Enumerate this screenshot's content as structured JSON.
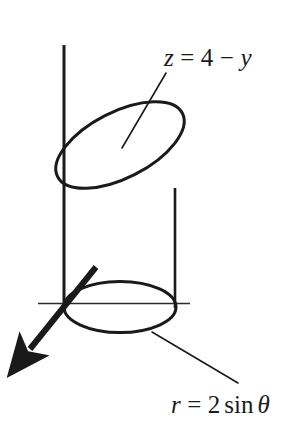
{
  "figure": {
    "background_color": "#ffffff",
    "stroke_color": "#1a1a1a",
    "axis_color": "#2b2b2b"
  },
  "labels": {
    "plane": {
      "name": "plane-equation",
      "full_text": "z = 4 − y",
      "lhs": "z",
      "equals": "=",
      "constant": "4",
      "minus": "−",
      "rhs_var": "y"
    },
    "cylinder": {
      "name": "cylinder-equation",
      "full_text": "r = 2 sin θ",
      "lhs": "r",
      "equals": "=",
      "coefficient": "2",
      "function": "sin",
      "angle": "θ"
    }
  },
  "geometry": {
    "z_axis": {
      "label": "z-axis",
      "x": 64,
      "y_top": 45,
      "y_bottom": 312
    },
    "y_axis": {
      "label": "y-axis",
      "x_left": 38,
      "x_right": 190,
      "y": 303
    },
    "x_axis_arrow": {
      "label": "x-axis",
      "start_x": 96,
      "start_y": 267,
      "end_x": 24,
      "end_y": 357,
      "arrowhead": "filled-triangle"
    },
    "bottom_ellipse": {
      "label": "cylinder-base",
      "center_x": 120,
      "center_y": 307,
      "radius_x": 56,
      "radius_y": 26,
      "rotation_deg": 0
    },
    "top_ellipse": {
      "label": "cylinder-top-cut",
      "center_x": 120,
      "center_y": 145,
      "radius_x": 70,
      "radius_y": 33,
      "rotation_deg": -27
    },
    "left_wall": {
      "label": "cylinder-left-wall",
      "x": 64,
      "y_top": 97,
      "y_bottom": 307
    },
    "right_wall": {
      "label": "cylinder-right-wall",
      "x": 175,
      "y_top": 190,
      "y_bottom": 307
    },
    "plane_leader": {
      "label": "plane-leader-line",
      "x1": 166,
      "y1": 73,
      "x2": 122,
      "y2": 148
    },
    "cylinder_leader": {
      "label": "cylinder-leader-line",
      "x1": 152,
      "y1": 332,
      "x2": 238,
      "y2": 383
    }
  }
}
